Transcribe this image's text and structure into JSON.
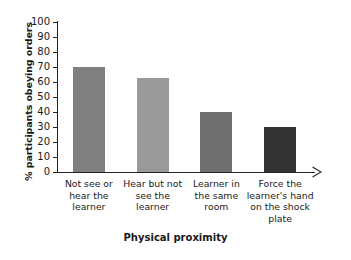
{
  "chart_data": {
    "type": "bar",
    "title": "",
    "xlabel": "Physical proximity",
    "ylabel": "% participants obeying orders",
    "categories": [
      "Not see or\nhear the\nlearner",
      "Hear but not\nsee the\nlearner",
      "Learner in\nthe same\nroom",
      "Force the\nlearner's hand\non the shock\nplate"
    ],
    "values": [
      70,
      62.5,
      40,
      30
    ],
    "ylim": [
      0,
      100
    ],
    "yticks": [
      0,
      10,
      20,
      30,
      40,
      50,
      60,
      70,
      80,
      90,
      100
    ],
    "ytick_labels": [
      "0",
      "10",
      "20",
      "30",
      "40",
      "50",
      "60",
      "70",
      "80",
      "90",
      "100"
    ],
    "grid": false,
    "legend": "none",
    "bar_colors": [
      "#808080",
      "#9a9a9a",
      "#707070",
      "#333333"
    ],
    "axis_color": "#222222",
    "background": "#ffffff"
  }
}
